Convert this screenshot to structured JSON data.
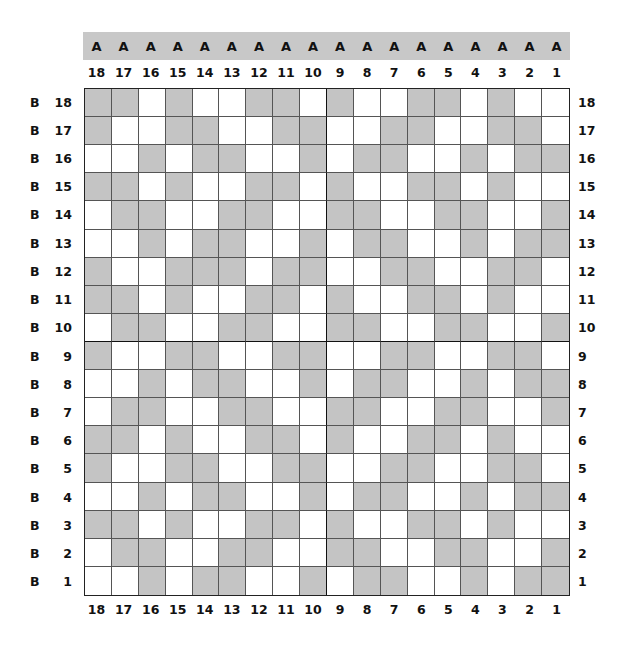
{
  "diagram": {
    "title": "",
    "top_header_letter": "A",
    "side_letter": "B",
    "columns": [
      "18",
      "17",
      "16",
      "15",
      "14",
      "13",
      "12",
      "11",
      "10",
      "9",
      "8",
      "7",
      "6",
      "5",
      "4",
      "3",
      "2",
      "1"
    ],
    "rows": [
      "18",
      "17",
      "16",
      "15",
      "14",
      "13",
      "12",
      "11",
      "10",
      "9",
      "8",
      "7",
      "6",
      "5",
      "4",
      "3",
      "2",
      "1"
    ],
    "colors": {
      "shaded": "#c4c4c4",
      "empty": "#ffffff",
      "header_bar": "#c8c8c8",
      "grid_line": "#555555",
      "quadrant_line": "#111111"
    },
    "legend": "G = shaded cell, W = white cell; each row lists columns A18 → A1",
    "cells": [
      "GGWGWWGGWGWWGGWGWW",
      "GWWGGWWGGWWGGWWGGW",
      "WWGWGGWWGWGGWWGWGG",
      "GGWGWWGGWGWWGGWGWW",
      "WGGWWGGWWGGWWGGWWG",
      "WWGWGGWWGWGGWWGWGG",
      "GWWGGGWGGWWGGWWGGW",
      "GGWGWWGGWGWWGGWGWW",
      "WGGWWGGWWGGWWGGWWG",
      "GWWGGWWGGWWGGWWGGW",
      "WWGWGGWWGWGGWWGWGG",
      "WGGWWGGWWGGWWGGWWG",
      "GGWGWWGGWGWWGGWGWW",
      "GWWGGWWGGWWGGWWGGW",
      "WWGWGGWWGWGGWWGWGG",
      "GGWGWWGGWGWWGGWGWW",
      "WGGWWGGWWGGWWGGWWG",
      "WWGWGGWWGWGGWWGWGG"
    ]
  }
}
